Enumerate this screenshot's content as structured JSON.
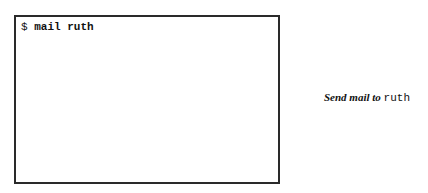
{
  "terminal": {
    "prompt": "$ ",
    "command": "mail ruth"
  },
  "caption": {
    "text": "Send mail to ",
    "argument": "ruth"
  }
}
